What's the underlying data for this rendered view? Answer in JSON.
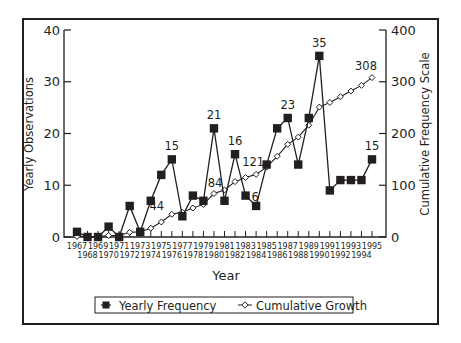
{
  "chart_data": {
    "type": "line",
    "title": "",
    "xlabel": "Year",
    "ylabel": "Yearly Observations",
    "y2label": "Cumulative Frequency Scale",
    "ylim": [
      0,
      40
    ],
    "y2lim": [
      0,
      400
    ],
    "yticks": [
      0,
      10,
      20,
      30,
      40
    ],
    "y2ticks": [
      0,
      100,
      200,
      300,
      400
    ],
    "grid": false,
    "legend_position": "bottom",
    "x": [
      1967,
      1968,
      1969,
      1970,
      1971,
      1972,
      1973,
      1974,
      1975,
      1976,
      1977,
      1978,
      1979,
      1980,
      1981,
      1982,
      1983,
      1984,
      1985,
      1986,
      1987,
      1988,
      1989,
      1990,
      1991,
      1992,
      1993,
      1994,
      1995
    ],
    "series": [
      {
        "name": "Yearly Frequency",
        "axis": "left",
        "marker": "filled-square",
        "values": [
          1,
          0,
          0,
          2,
          0,
          6,
          1,
          7,
          12,
          15,
          4,
          8,
          7,
          21,
          7,
          16,
          8,
          6,
          14,
          21,
          23,
          14,
          23,
          35,
          9,
          11,
          11,
          11,
          15
        ]
      },
      {
        "name": "Cumulative Growth",
        "axis": "right",
        "marker": "open-diamond",
        "values": [
          1,
          1,
          1,
          3,
          3,
          9,
          10,
          17,
          29,
          44,
          48,
          56,
          63,
          84,
          91,
          107,
          115,
          121,
          135,
          156,
          179,
          193,
          216,
          251,
          260,
          271,
          282,
          293,
          308
        ]
      }
    ],
    "annotations": [
      {
        "series": "Yearly Frequency",
        "x": 1976,
        "text": "15"
      },
      {
        "series": "Yearly Frequency",
        "x": 1980,
        "text": "21"
      },
      {
        "series": "Yearly Frequency",
        "x": 1982,
        "text": "16"
      },
      {
        "series": "Yearly Frequency",
        "x": 1984,
        "text": "6"
      },
      {
        "series": "Yearly Frequency",
        "x": 1987,
        "text": "23"
      },
      {
        "series": "Yearly Frequency",
        "x": 1990,
        "text": "35"
      },
      {
        "series": "Yearly Frequency",
        "x": 1995,
        "text": "15"
      },
      {
        "series": "Cumulative Growth",
        "x": 1976,
        "text": "44"
      },
      {
        "series": "Cumulative Growth",
        "x": 1980,
        "text": "84"
      },
      {
        "series": "Cumulative Growth",
        "x": 1984,
        "text": "121"
      },
      {
        "series": "Cumulative Growth",
        "x": 1995,
        "text": "308"
      }
    ]
  },
  "legend": {
    "items": [
      {
        "label": "Yearly Frequency",
        "icon": "filled-square-icon"
      },
      {
        "label": "Cumulative Growth",
        "icon": "open-diamond-line-icon"
      }
    ]
  },
  "colors": {
    "ink": "#231f20",
    "background": "#ffffff"
  }
}
